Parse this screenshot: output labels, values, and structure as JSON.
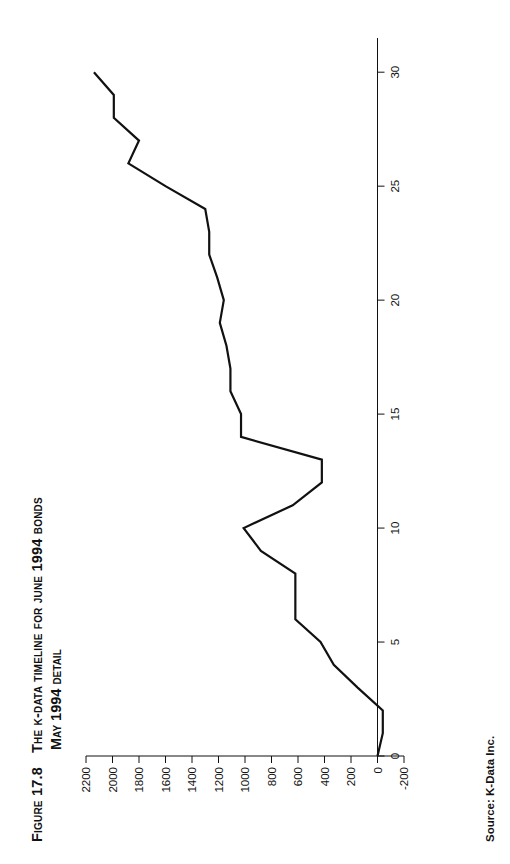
{
  "figure": {
    "number_label": "FIGURE 17.8",
    "title_line1": "THE K-DATA TIMELINE FOR JUNE 1994 BONDS",
    "title_line2": "MAY 1994 DETAIL",
    "source": "Source: K-Data Inc.",
    "source_label": "Source:",
    "source_value": "K-Data Inc.",
    "page_background": "#ffffff",
    "ink_color": "#111111"
  },
  "chart_data": {
    "type": "line",
    "title": "THE K-DATA TIMELINE FOR JUNE 1994 BONDS MAY 1994 DETAIL",
    "subtitle": "MAY 1994 DETAIL",
    "xlabel": "",
    "ylabel": "",
    "xlim": [
      0,
      31.5
    ],
    "ylim": [
      -200,
      2200
    ],
    "xticks": [
      0,
      5,
      10,
      15,
      20,
      25,
      30
    ],
    "xtick_labels": [
      "0",
      "5",
      "10",
      "15",
      "20",
      "25",
      "30"
    ],
    "yticks": [
      -200,
      0,
      200,
      400,
      600,
      800,
      1000,
      1200,
      1400,
      1600,
      1800,
      2000,
      2200
    ],
    "ytick_labels": [
      "-200",
      "0",
      "200",
      "400",
      "600",
      "800",
      "1000",
      "1200",
      "1400",
      "1600",
      "1800",
      "2000",
      "2200"
    ],
    "grid": false,
    "legend": false,
    "legend_position": "none",
    "line_color": "#111111",
    "line_width": 2.2,
    "series": [
      {
        "name": "K-Data timeline",
        "x": [
          0,
          1,
          2,
          3,
          4,
          5,
          6,
          7,
          8,
          9,
          10,
          11,
          12,
          13,
          14,
          15,
          16,
          17,
          18,
          19,
          20,
          21,
          22,
          23,
          24,
          25,
          26,
          27,
          28,
          29,
          30
        ],
        "values": [
          0,
          -40,
          -40,
          150,
          330,
          430,
          620,
          620,
          620,
          880,
          1010,
          640,
          420,
          420,
          1030,
          1030,
          1110,
          1110,
          1140,
          1190,
          1160,
          1210,
          1270,
          1270,
          1300,
          1600,
          1880,
          1800,
          1990,
          1990,
          2140
        ]
      }
    ],
    "annotations": []
  },
  "axes": {
    "y_axis_name": "value-axis",
    "x_axis_name": "day-axis"
  }
}
